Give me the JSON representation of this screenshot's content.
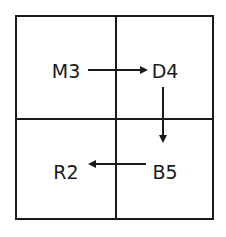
{
  "diagram": {
    "type": "grid-flow",
    "rows": 2,
    "cols": 2,
    "line_color": "#1a1a1a",
    "arrow_color": "#1a1a1a",
    "cells": [
      {
        "id": "top-left",
        "label": "M3",
        "row": 0,
        "col": 0
      },
      {
        "id": "top-right",
        "label": "D4",
        "row": 0,
        "col": 1
      },
      {
        "id": "bottom-right",
        "label": "B5",
        "row": 1,
        "col": 1
      },
      {
        "id": "bottom-left",
        "label": "R2",
        "row": 1,
        "col": 0
      }
    ],
    "arrows": [
      {
        "from": "M3",
        "to": "D4",
        "direction": "right"
      },
      {
        "from": "D4",
        "to": "B5",
        "direction": "down"
      },
      {
        "from": "B5",
        "to": "R2",
        "direction": "left"
      }
    ]
  }
}
